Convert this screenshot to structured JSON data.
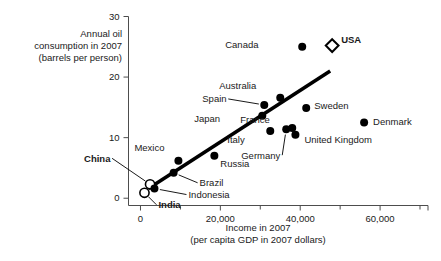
{
  "chart_data": {
    "type": "scatter",
    "title": "",
    "xlabel": "Income in 2007",
    "xlabel_sub": "(per capita GDP in 2007 dollars)",
    "ylabel_lines": [
      "Annual oil",
      "consumption in 2007",
      "(barrels per person)"
    ],
    "xlim": [
      -3000,
      72000
    ],
    "ylim": [
      -1.2,
      30
    ],
    "xticks": [
      0,
      20000,
      40000,
      60000
    ],
    "xtick_labels": [
      "0",
      "20,000",
      "40,000",
      "60,000"
    ],
    "xticks_minor": [
      10000,
      30000,
      50000,
      70000
    ],
    "yticks": [
      0,
      10,
      20,
      30
    ],
    "ytick_labels": [
      "0",
      "10",
      "20",
      "30"
    ],
    "grid": false,
    "legend": "none",
    "marker_color": "#000000",
    "trendline": {
      "label": "",
      "x0": 2000,
      "y0": 1.6,
      "x1": 47500,
      "y1": 21.0,
      "color": "#000000"
    },
    "points": [
      {
        "name": "India",
        "x": 1000,
        "y": 0.9,
        "marker": "open-circle",
        "label_bold": true,
        "label_dx": 14,
        "label_dy": 12,
        "leader": true
      },
      {
        "name": "China",
        "x": 2400,
        "y": 2.3,
        "marker": "open-circle",
        "label_bold": true,
        "label_dx": -40,
        "label_dy": -26,
        "leader": true
      },
      {
        "name": "Indonesia",
        "x": 3500,
        "y": 1.6,
        "marker": "filled-circle",
        "label_bold": false,
        "label_dx": 34,
        "label_dy": 6,
        "leader": true
      },
      {
        "name": "Brazil",
        "x": 8300,
        "y": 4.2,
        "marker": "filled-circle",
        "label_bold": false,
        "label_dx": 26,
        "label_dy": 10,
        "leader": true
      },
      {
        "name": "Mexico",
        "x": 9500,
        "y": 6.2,
        "marker": "filled-circle",
        "label_bold": false,
        "label_dx": -14,
        "label_dy": -13,
        "leader": false
      },
      {
        "name": "Russia",
        "x": 18500,
        "y": 7.0,
        "marker": "filled-circle",
        "label_bold": false,
        "label_dx": 6,
        "label_dy": 8,
        "leader": false
      },
      {
        "name": "Japan",
        "x": 30500,
        "y": 13.6,
        "marker": "filled-circle",
        "label_bold": false,
        "label_dx": -42,
        "label_dy": 3,
        "leader": false
      },
      {
        "name": "Spain",
        "x": 31000,
        "y": 15.4,
        "marker": "filled-circle",
        "label_bold": false,
        "label_dx": -38,
        "label_dy": -6,
        "leader": true
      },
      {
        "name": "Italy",
        "x": 32500,
        "y": 11.1,
        "marker": "filled-circle",
        "label_bold": false,
        "label_dx": -26,
        "label_dy": 9,
        "leader": false
      },
      {
        "name": "Australia",
        "x": 35000,
        "y": 16.6,
        "marker": "filled-circle",
        "label_bold": false,
        "label_dx": -24,
        "label_dy": -12,
        "leader": false
      },
      {
        "name": "Germany",
        "x": 36500,
        "y": 11.4,
        "marker": "filled-circle",
        "label_bold": false,
        "label_dx": -6,
        "label_dy": 26,
        "leader": true
      },
      {
        "name": "France",
        "x": 38000,
        "y": 11.6,
        "marker": "filled-circle",
        "label_bold": false,
        "label_dx": -22,
        "label_dy": -8,
        "leader": false
      },
      {
        "name": "United Kingdom",
        "x": 38800,
        "y": 10.5,
        "marker": "filled-circle",
        "label_bold": false,
        "label_dx": 9,
        "label_dy": 5,
        "leader": false
      },
      {
        "name": "Sweden",
        "x": 41500,
        "y": 14.9,
        "marker": "filled-circle",
        "label_bold": false,
        "label_dx": 8,
        "label_dy": -2,
        "leader": false
      },
      {
        "name": "Canada",
        "x": 40500,
        "y": 25.0,
        "marker": "filled-circle",
        "label_bold": false,
        "label_dx": -44,
        "label_dy": -2,
        "leader": false
      },
      {
        "name": "Denmark",
        "x": 56000,
        "y": 12.5,
        "marker": "filled-circle",
        "label_bold": false,
        "label_dx": 9,
        "label_dy": -1,
        "leader": false
      },
      {
        "name": "USA",
        "x": 48000,
        "y": 25.2,
        "marker": "open-diamond",
        "label_bold": true,
        "label_dx": 9,
        "label_dy": -6,
        "leader": false
      }
    ]
  }
}
